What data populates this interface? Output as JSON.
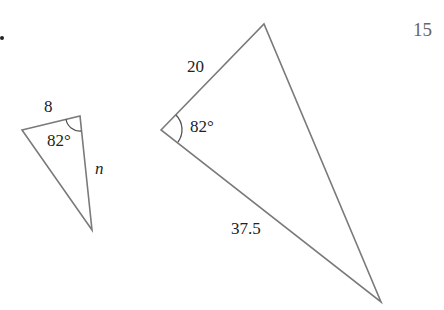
{
  "problem": {
    "number": "15",
    "bullet": "•"
  },
  "small_triangle": {
    "side_top_label": "8",
    "angle_label": "82°",
    "side_right_label": "n",
    "vertices": [
      [
        22,
        130
      ],
      [
        80,
        116
      ],
      [
        92,
        230
      ]
    ]
  },
  "large_triangle": {
    "side_upper_label": "20",
    "angle_label": "82°",
    "side_lower_label": "37.5",
    "vertices": [
      [
        161,
        130
      ],
      [
        264,
        24
      ],
      [
        381,
        302
      ]
    ]
  },
  "colors": {
    "stroke": "#7a7a7a",
    "text": "#222222",
    "number": "#666666"
  }
}
